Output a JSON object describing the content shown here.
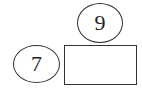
{
  "diagram": {
    "top_ellipse": {
      "value": "9"
    },
    "left_ellipse": {
      "value": "7"
    },
    "answer_box": {
      "value": ""
    }
  },
  "colors": {
    "stroke": "#333333",
    "text": "#222222",
    "background": "#ffffff"
  }
}
